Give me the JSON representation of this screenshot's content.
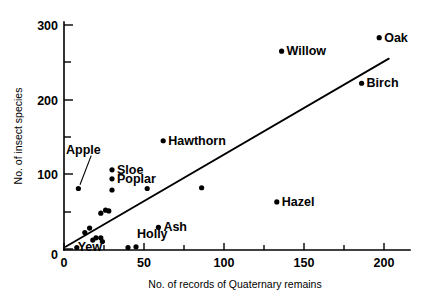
{
  "chart_data": {
    "type": "scatter",
    "title": "",
    "xlabel": "No. of records of Quaternary remains",
    "ylabel": "No. of insect species",
    "xlim": [
      0,
      215
    ],
    "ylim": [
      0,
      320
    ],
    "xticks": [
      0,
      50,
      100,
      150,
      200
    ],
    "xtick_labels": [
      "0",
      "50",
      "100",
      "150",
      "200"
    ],
    "xminorticks": [
      25,
      75,
      125,
      175
    ],
    "yticks": [
      0,
      100,
      200,
      300
    ],
    "ytick_labels": [
      "0",
      "100",
      "200",
      "300"
    ],
    "yminorticks": [
      50,
      150,
      250
    ],
    "grid": false,
    "legend": false,
    "points": [
      {
        "label": "Oak",
        "x": 197,
        "y": 283,
        "label_dx": 5,
        "label_dy": 4
      },
      {
        "label": "Willow",
        "x": 136,
        "y": 265,
        "label_dx": 5,
        "label_dy": 4
      },
      {
        "label": "Birch",
        "x": 186,
        "y": 222,
        "label_dx": 5,
        "label_dy": 4
      },
      {
        "label": "Hawthorn",
        "x": 62,
        "y": 145,
        "label_dx": 5,
        "label_dy": 4
      },
      {
        "label": "Sloe",
        "x": 30,
        "y": 106,
        "label_dx": 5,
        "label_dy": 4
      },
      {
        "label": "Poplar",
        "x": 30,
        "y": 94,
        "label_dx": 5,
        "label_dy": 4
      },
      {
        "label": "Apple",
        "x": 9,
        "y": 81,
        "label_dx": 0,
        "label_dy": 0
      },
      {
        "label": "Hazel",
        "x": 133,
        "y": 63,
        "label_dx": 5,
        "label_dy": 4
      },
      {
        "label": "Ash",
        "x": 59,
        "y": 29,
        "label_dx": 5,
        "label_dy": 4
      },
      {
        "label": "Holly",
        "x": 45,
        "y": 3,
        "label_dx": 1,
        "label_dy": -9
      },
      {
        "label": "Yew",
        "x": 40,
        "y": 2,
        "label_dx": -26,
        "label_dy": 3
      }
    ],
    "unlabeled_points": [
      {
        "x": 30,
        "y": 79
      },
      {
        "x": 28,
        "y": 51
      },
      {
        "x": 52,
        "y": 81
      },
      {
        "x": 86,
        "y": 82
      },
      {
        "x": 26,
        "y": 52
      },
      {
        "x": 23,
        "y": 48
      },
      {
        "x": 16,
        "y": 28
      },
      {
        "x": 13,
        "y": 22
      },
      {
        "x": 20,
        "y": 15
      },
      {
        "x": 23,
        "y": 15
      },
      {
        "x": 24,
        "y": 10
      },
      {
        "x": 18,
        "y": 12
      },
      {
        "x": 8,
        "y": 2
      }
    ],
    "fit_line": {
      "x1": 1,
      "y1": 3,
      "x2": 203,
      "y2": 255
    },
    "apple_leader": {
      "from_x": 17,
      "from_y": 125,
      "to_x": 10,
      "to_y": 86
    }
  }
}
